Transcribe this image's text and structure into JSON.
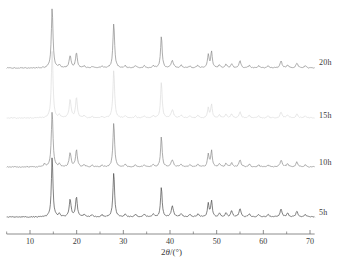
{
  "chart_data": {
    "type": "line",
    "title": "",
    "xlabel": "2θ/(°)",
    "ylabel": "",
    "xlim": [
      5,
      71
    ],
    "ylim": [
      0,
      1
    ],
    "grid": false,
    "legend_position": "right-inline",
    "axis": {
      "tick_values": [
        10,
        20,
        30,
        40,
        50,
        60,
        70
      ],
      "tick_labels": [
        "10",
        "20",
        "30",
        "40",
        "50",
        "60",
        "70"
      ],
      "minor_ticks": [
        5,
        15,
        25,
        35,
        45,
        55,
        65
      ],
      "axis_label": "2θ/(°)",
      "axis_color": "#707070"
    },
    "series": [
      {
        "name": "20h",
        "label": "20h",
        "color": "#8a8a8a",
        "baseline_y": 68,
        "peaks": [
          {
            "x": 14.75,
            "h": 60,
            "w": 0.42
          },
          {
            "x": 16.3,
            "h": 2.5,
            "w": 0.4
          },
          {
            "x": 18.6,
            "h": 12,
            "w": 0.5
          },
          {
            "x": 19.95,
            "h": 15,
            "w": 0.45
          },
          {
            "x": 21.6,
            "h": 2,
            "w": 0.45
          },
          {
            "x": 23.3,
            "h": 1.5,
            "w": 0.45
          },
          {
            "x": 25.4,
            "h": 1.5,
            "w": 0.45
          },
          {
            "x": 27.95,
            "h": 45,
            "w": 0.42
          },
          {
            "x": 30.4,
            "h": 2,
            "w": 0.5
          },
          {
            "x": 32.6,
            "h": 2,
            "w": 0.5
          },
          {
            "x": 34.5,
            "h": 2,
            "w": 0.5
          },
          {
            "x": 36.4,
            "h": 2,
            "w": 0.5
          },
          {
            "x": 38.15,
            "h": 32,
            "w": 0.4
          },
          {
            "x": 40.5,
            "h": 7,
            "w": 0.6
          },
          {
            "x": 42.4,
            "h": 2.5,
            "w": 0.5
          },
          {
            "x": 44.3,
            "h": 2,
            "w": 0.5
          },
          {
            "x": 46.0,
            "h": 2.5,
            "w": 0.5
          },
          {
            "x": 48.2,
            "h": 13,
            "w": 0.4
          },
          {
            "x": 48.9,
            "h": 16,
            "w": 0.4
          },
          {
            "x": 50.6,
            "h": 3,
            "w": 0.45
          },
          {
            "x": 52.0,
            "h": 3.5,
            "w": 0.45
          },
          {
            "x": 53.2,
            "h": 4,
            "w": 0.45
          },
          {
            "x": 55.0,
            "h": 7,
            "w": 0.5
          },
          {
            "x": 57.0,
            "h": 2.5,
            "w": 0.5
          },
          {
            "x": 59.0,
            "h": 2,
            "w": 0.5
          },
          {
            "x": 61.0,
            "h": 2,
            "w": 0.5
          },
          {
            "x": 63.8,
            "h": 7,
            "w": 0.5
          },
          {
            "x": 65.2,
            "h": 3,
            "w": 0.5
          },
          {
            "x": 67.2,
            "h": 5,
            "w": 0.5
          },
          {
            "x": 69.0,
            "h": 2,
            "w": 0.5
          }
        ]
      },
      {
        "name": "15h",
        "label": "15h",
        "color": "#dcdcdc",
        "baseline_y": 118,
        "peaks": [
          {
            "x": 14.75,
            "h": 68,
            "w": 0.42
          },
          {
            "x": 16.3,
            "h": 2.5,
            "w": 0.4
          },
          {
            "x": 18.6,
            "h": 18,
            "w": 0.5
          },
          {
            "x": 19.95,
            "h": 20,
            "w": 0.45
          },
          {
            "x": 21.6,
            "h": 2,
            "w": 0.45
          },
          {
            "x": 23.3,
            "h": 1.5,
            "w": 0.45
          },
          {
            "x": 25.4,
            "h": 1.5,
            "w": 0.45
          },
          {
            "x": 27.95,
            "h": 48,
            "w": 0.42
          },
          {
            "x": 30.4,
            "h": 2,
            "w": 0.5
          },
          {
            "x": 32.6,
            "h": 2,
            "w": 0.5
          },
          {
            "x": 34.5,
            "h": 2,
            "w": 0.5
          },
          {
            "x": 36.4,
            "h": 2,
            "w": 0.5
          },
          {
            "x": 38.15,
            "h": 36,
            "w": 0.4
          },
          {
            "x": 40.5,
            "h": 8,
            "w": 0.6
          },
          {
            "x": 42.4,
            "h": 2.5,
            "w": 0.5
          },
          {
            "x": 44.3,
            "h": 2,
            "w": 0.5
          },
          {
            "x": 46.0,
            "h": 2.5,
            "w": 0.5
          },
          {
            "x": 48.2,
            "h": 10,
            "w": 0.4
          },
          {
            "x": 48.9,
            "h": 13,
            "w": 0.4
          },
          {
            "x": 50.6,
            "h": 3,
            "w": 0.45
          },
          {
            "x": 52.0,
            "h": 3.5,
            "w": 0.45
          },
          {
            "x": 53.2,
            "h": 4,
            "w": 0.45
          },
          {
            "x": 55.0,
            "h": 6,
            "w": 0.5
          },
          {
            "x": 57.0,
            "h": 2.5,
            "w": 0.5
          },
          {
            "x": 59.0,
            "h": 2,
            "w": 0.5
          },
          {
            "x": 61.0,
            "h": 2,
            "w": 0.5
          },
          {
            "x": 63.8,
            "h": 6,
            "w": 0.5
          },
          {
            "x": 65.2,
            "h": 3,
            "w": 0.5
          },
          {
            "x": 67.2,
            "h": 4,
            "w": 0.5
          },
          {
            "x": 69.0,
            "h": 2,
            "w": 0.5
          }
        ]
      },
      {
        "name": "10h",
        "label": "10h",
        "color": "#8a8a8a",
        "baseline_y": 167,
        "peaks": [
          {
            "x": 14.75,
            "h": 56,
            "w": 0.42
          },
          {
            "x": 13.1,
            "h": 3,
            "w": 0.4
          },
          {
            "x": 16.3,
            "h": 2.5,
            "w": 0.4
          },
          {
            "x": 18.6,
            "h": 14,
            "w": 0.5
          },
          {
            "x": 19.95,
            "h": 17,
            "w": 0.45
          },
          {
            "x": 21.6,
            "h": 2,
            "w": 0.45
          },
          {
            "x": 23.3,
            "h": 1.5,
            "w": 0.45
          },
          {
            "x": 25.4,
            "h": 1.5,
            "w": 0.45
          },
          {
            "x": 27.95,
            "h": 44,
            "w": 0.42
          },
          {
            "x": 30.4,
            "h": 2,
            "w": 0.5
          },
          {
            "x": 32.6,
            "h": 2,
            "w": 0.5
          },
          {
            "x": 34.5,
            "h": 2,
            "w": 0.5
          },
          {
            "x": 36.4,
            "h": 2,
            "w": 0.5
          },
          {
            "x": 38.15,
            "h": 30,
            "w": 0.4
          },
          {
            "x": 40.5,
            "h": 7,
            "w": 0.6
          },
          {
            "x": 42.4,
            "h": 2.5,
            "w": 0.5
          },
          {
            "x": 44.3,
            "h": 2,
            "w": 0.5
          },
          {
            "x": 46.0,
            "h": 2.5,
            "w": 0.5
          },
          {
            "x": 48.2,
            "h": 13,
            "w": 0.4
          },
          {
            "x": 48.9,
            "h": 16,
            "w": 0.4
          },
          {
            "x": 50.6,
            "h": 3,
            "w": 0.45
          },
          {
            "x": 52.0,
            "h": 3.5,
            "w": 0.45
          },
          {
            "x": 53.2,
            "h": 4,
            "w": 0.45
          },
          {
            "x": 55.0,
            "h": 7,
            "w": 0.5
          },
          {
            "x": 57.0,
            "h": 2.5,
            "w": 0.5
          },
          {
            "x": 59.0,
            "h": 2,
            "w": 0.5
          },
          {
            "x": 61.0,
            "h": 2,
            "w": 0.5
          },
          {
            "x": 63.8,
            "h": 7,
            "w": 0.5
          },
          {
            "x": 65.2,
            "h": 3,
            "w": 0.5
          },
          {
            "x": 67.2,
            "h": 5,
            "w": 0.5
          },
          {
            "x": 69.0,
            "h": 2,
            "w": 0.5
          }
        ]
      },
      {
        "name": "5h",
        "label": "5h",
        "color": "#4a4a4a",
        "baseline_y": 217,
        "peaks": [
          {
            "x": 14.75,
            "h": 60,
            "w": 0.4
          },
          {
            "x": 16.3,
            "h": 3,
            "w": 0.4
          },
          {
            "x": 18.6,
            "h": 17,
            "w": 0.5
          },
          {
            "x": 19.95,
            "h": 20,
            "w": 0.45
          },
          {
            "x": 21.6,
            "h": 2.5,
            "w": 0.45
          },
          {
            "x": 23.3,
            "h": 2,
            "w": 0.45
          },
          {
            "x": 25.4,
            "h": 2,
            "w": 0.45
          },
          {
            "x": 27.95,
            "h": 44,
            "w": 0.42
          },
          {
            "x": 30.4,
            "h": 2.5,
            "w": 0.5
          },
          {
            "x": 32.6,
            "h": 2.5,
            "w": 0.5
          },
          {
            "x": 34.5,
            "h": 2.5,
            "w": 0.5
          },
          {
            "x": 36.4,
            "h": 2.5,
            "w": 0.5
          },
          {
            "x": 38.15,
            "h": 30,
            "w": 0.4
          },
          {
            "x": 40.5,
            "h": 11,
            "w": 0.55
          },
          {
            "x": 42.4,
            "h": 3,
            "w": 0.5
          },
          {
            "x": 44.3,
            "h": 2.5,
            "w": 0.5
          },
          {
            "x": 46.0,
            "h": 3,
            "w": 0.5
          },
          {
            "x": 48.2,
            "h": 13,
            "w": 0.4
          },
          {
            "x": 48.9,
            "h": 16,
            "w": 0.4
          },
          {
            "x": 50.6,
            "h": 4,
            "w": 0.45
          },
          {
            "x": 52.0,
            "h": 4,
            "w": 0.45
          },
          {
            "x": 53.2,
            "h": 6,
            "w": 0.45
          },
          {
            "x": 55.0,
            "h": 8,
            "w": 0.5
          },
          {
            "x": 57.0,
            "h": 3,
            "w": 0.5
          },
          {
            "x": 59.0,
            "h": 2.5,
            "w": 0.5
          },
          {
            "x": 61.0,
            "h": 2.5,
            "w": 0.5
          },
          {
            "x": 63.8,
            "h": 8,
            "w": 0.5
          },
          {
            "x": 65.2,
            "h": 3.5,
            "w": 0.5
          },
          {
            "x": 67.2,
            "h": 6,
            "w": 0.5
          },
          {
            "x": 69.0,
            "h": 2.5,
            "w": 0.5
          }
        ]
      }
    ]
  },
  "labels": {
    "series_20h": "20h",
    "series_15h": "15h",
    "series_10h": "10h",
    "series_5h": "5h",
    "tick_10": "10",
    "tick_20": "20",
    "tick_30": "30",
    "tick_40": "40",
    "tick_50": "50",
    "tick_60": "60",
    "tick_70": "70",
    "axis_title_pre": "2",
    "axis_title_theta": "θ",
    "axis_title_post": "/(°)"
  }
}
